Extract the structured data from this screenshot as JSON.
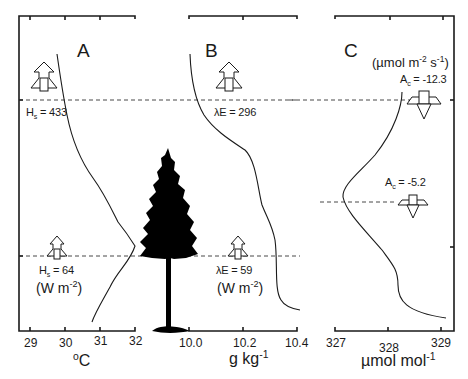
{
  "figure": {
    "panels": [
      {
        "id": "A",
        "letter": "A",
        "variable": "air temperature",
        "axis_unit": "°C",
        "ticks": [
          "29",
          "30",
          "31",
          "32"
        ],
        "fluxes": [
          {
            "symbol": "H",
            "subscript": "s",
            "value": "433",
            "direction": "up"
          },
          {
            "symbol": "H",
            "subscript": "s",
            "value": "64",
            "direction": "up"
          }
        ],
        "flux_unit": "(W m-2)"
      },
      {
        "id": "B",
        "letter": "B",
        "variable": "specific humidity",
        "axis_unit": "g kg-1",
        "ticks": [
          "10.0",
          "10.2",
          "10.4"
        ],
        "fluxes": [
          {
            "symbol": "λE",
            "subscript": "",
            "value": "296",
            "direction": "up"
          },
          {
            "symbol": "λE",
            "subscript": "",
            "value": "59",
            "direction": "up"
          }
        ],
        "flux_unit": "(W m-2)"
      },
      {
        "id": "C",
        "letter": "C",
        "variable": "CO2 concentration",
        "axis_unit": "µmol mol-1",
        "ticks": [
          "327",
          "328",
          "329"
        ],
        "fluxes": [
          {
            "symbol": "A",
            "subscript": "c",
            "value": "-12.3",
            "direction": "down"
          },
          {
            "symbol": "A",
            "subscript": "c",
            "value": "-5.2",
            "direction": "down"
          }
        ],
        "flux_unit": "(µmol m-2 s-1)"
      }
    ],
    "labels": {
      "A_letter": "A",
      "B_letter": "B",
      "C_letter": "C",
      "A_flux_top": "H",
      "A_flux_top_sub": "s",
      "A_flux_top_val": " = 433",
      "A_flux_bot": "H",
      "A_flux_bot_sub": "s",
      "A_flux_bot_val": " = 64",
      "A_unit_open": "(W m",
      "A_unit_exp": "-2",
      "A_unit_close": ")",
      "B_flux_top": "λE = 296",
      "B_flux_bot": "λE = 59",
      "B_unit_open": "(W m",
      "B_unit_exp": "-2",
      "B_unit_close": ")",
      "C_unit_open": "(µmol m",
      "C_unit_exp1": "-2",
      "C_unit_mid": " s",
      "C_unit_exp2": "-1",
      "C_unit_close": ")",
      "C_flux_top": "A",
      "C_flux_top_sub": "c",
      "C_flux_top_val": " = -12.3",
      "C_flux_bot": "A",
      "C_flux_bot_sub": "c",
      "C_flux_bot_val": " = -5.2",
      "A_axis_unit_sup": "o",
      "A_axis_unit": "C",
      "B_axis_unit": "g kg",
      "B_axis_unit_exp": "-1",
      "C_axis_unit": "µmol mol",
      "C_axis_unit_exp": "-1",
      "A_ticks": [
        "29",
        "30",
        "31",
        "32"
      ],
      "B_ticks": [
        "10.0",
        "10.2",
        "10.4"
      ],
      "C_ticks": [
        "327",
        "328",
        "329"
      ]
    },
    "icons": [
      "upward-flux-arrow-icon",
      "downward-flux-arrow-icon",
      "conifer-tree-icon"
    ]
  }
}
